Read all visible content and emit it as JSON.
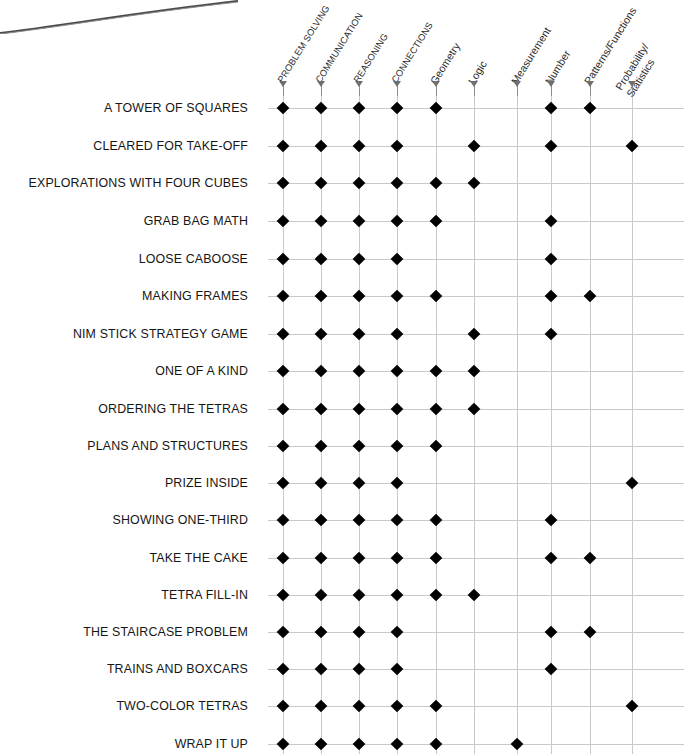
{
  "chart_data": {
    "type": "heatmap",
    "title": "",
    "xlabel": "",
    "ylabel": "",
    "legend_position": "none",
    "grid": true,
    "marker": "filled-diamond",
    "marker_color": "#000000",
    "grid_color": "#c9c9c9",
    "categories": [
      "PROBLEM SOLVING",
      "COMMUNICATION",
      "REASONING",
      "CONNECTIONS",
      "Geometry",
      "Logic",
      "Measurement",
      "Number",
      "Patterns/Functions",
      "Probability/ Statistics"
    ],
    "column_headers": [
      {
        "label": "PROBLEM SOLVING",
        "style": "uppercase",
        "lines": [
          "PROBLEM SOLVING"
        ]
      },
      {
        "label": "COMMUNICATION",
        "style": "uppercase",
        "lines": [
          "COMMUNICATION"
        ]
      },
      {
        "label": "REASONING",
        "style": "uppercase",
        "lines": [
          "REASONING"
        ]
      },
      {
        "label": "CONNECTIONS",
        "style": "uppercase",
        "lines": [
          "CONNECTIONS"
        ]
      },
      {
        "label": "Geometry",
        "style": "titlecase",
        "lines": [
          "Geometry"
        ]
      },
      {
        "label": "Logic",
        "style": "titlecase",
        "lines": [
          "Logic"
        ]
      },
      {
        "label": "Measurement",
        "style": "titlecase",
        "lines": [
          "Measurement"
        ]
      },
      {
        "label": "Number",
        "style": "titlecase",
        "lines": [
          "Number"
        ]
      },
      {
        "label": "Patterns/Functions",
        "style": "titlecase",
        "lines": [
          "Patterns/Functions"
        ]
      },
      {
        "label": "Probability/ Statistics",
        "style": "titlecase",
        "lines": [
          "Probability/",
          "Statistics"
        ]
      }
    ],
    "rows": [
      {
        "label": "A TOWER OF SQUARES",
        "values": [
          1,
          1,
          1,
          1,
          1,
          0,
          0,
          1,
          1,
          0
        ]
      },
      {
        "label": "CLEARED FOR TAKE-OFF",
        "values": [
          1,
          1,
          1,
          1,
          0,
          1,
          0,
          1,
          0,
          1
        ]
      },
      {
        "label": "EXPLORATIONS WITH FOUR CUBES",
        "values": [
          1,
          1,
          1,
          1,
          1,
          1,
          0,
          0,
          0,
          0
        ]
      },
      {
        "label": "GRAB BAG MATH",
        "values": [
          1,
          1,
          1,
          1,
          1,
          0,
          0,
          1,
          0,
          0
        ]
      },
      {
        "label": "LOOSE CABOOSE",
        "values": [
          1,
          1,
          1,
          1,
          0,
          0,
          0,
          1,
          0,
          0
        ]
      },
      {
        "label": "MAKING FRAMES",
        "values": [
          1,
          1,
          1,
          1,
          1,
          0,
          0,
          1,
          1,
          0
        ]
      },
      {
        "label": "NIM STICK STRATEGY GAME",
        "values": [
          1,
          1,
          1,
          1,
          0,
          1,
          0,
          1,
          0,
          0
        ]
      },
      {
        "label": "ONE OF A KIND",
        "values": [
          1,
          1,
          1,
          1,
          1,
          1,
          0,
          0,
          0,
          0
        ]
      },
      {
        "label": "ORDERING THE TETRAS",
        "values": [
          1,
          1,
          1,
          1,
          1,
          1,
          0,
          0,
          0,
          0
        ]
      },
      {
        "label": "PLANS AND STRUCTURES",
        "values": [
          1,
          1,
          1,
          1,
          1,
          0,
          0,
          0,
          0,
          0
        ]
      },
      {
        "label": "PRIZE INSIDE",
        "values": [
          1,
          1,
          1,
          1,
          0,
          0,
          0,
          0,
          0,
          1
        ]
      },
      {
        "label": "SHOWING ONE-THIRD",
        "values": [
          1,
          1,
          1,
          1,
          1,
          0,
          0,
          1,
          0,
          0
        ]
      },
      {
        "label": "TAKE THE CAKE",
        "values": [
          1,
          1,
          1,
          1,
          1,
          0,
          0,
          1,
          1,
          0
        ]
      },
      {
        "label": "TETRA FILL-IN",
        "values": [
          1,
          1,
          1,
          1,
          1,
          1,
          0,
          0,
          0,
          0
        ]
      },
      {
        "label": "THE STAIRCASE PROBLEM",
        "values": [
          1,
          1,
          1,
          1,
          0,
          0,
          0,
          1,
          1,
          0
        ]
      },
      {
        "label": "TRAINS AND BOXCARS",
        "values": [
          1,
          1,
          1,
          1,
          0,
          0,
          0,
          1,
          0,
          0
        ]
      },
      {
        "label": "TWO-COLOR TETRAS",
        "values": [
          1,
          1,
          1,
          1,
          1,
          0,
          0,
          0,
          0,
          1
        ]
      },
      {
        "label": "WRAP IT UP",
        "values": [
          1,
          1,
          1,
          1,
          1,
          0,
          1,
          0,
          0,
          0
        ]
      }
    ]
  },
  "layout": {
    "column_x": [
      283,
      321,
      359,
      397,
      436,
      474,
      517,
      551,
      590,
      632
    ],
    "row_y": [
      108,
      146,
      183,
      221,
      259,
      296,
      334,
      371,
      409,
      446,
      483,
      520,
      558,
      595,
      632,
      669,
      706,
      744
    ],
    "label_right": 248,
    "header_baseline_y": 88,
    "tick_top": 82,
    "tick_height": 14,
    "grid_left": 268,
    "grid_right": 684
  }
}
